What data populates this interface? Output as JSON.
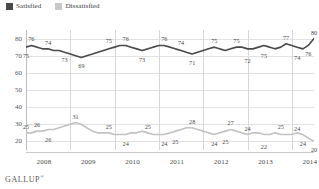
{
  "legend": {
    "items": [
      {
        "label": "Satisfied",
        "color": "#4a4a4a",
        "icon": "square-swatch-icon"
      },
      {
        "label": "Dissatisfied",
        "color": "#c8c8c8",
        "icon": "square-swatch-icon"
      }
    ]
  },
  "brand": {
    "name": "GALLUP",
    "mark": "®"
  },
  "axes": {
    "y_ticks": [
      "80",
      "70",
      "60",
      "50",
      "40",
      "30",
      "20"
    ],
    "x_ticks": [
      "2008",
      "2009",
      "2010",
      "2011",
      "2012",
      "2013",
      "2014"
    ]
  },
  "chart_data": {
    "type": "line",
    "title": "",
    "subtitle": "",
    "xlabel": "",
    "ylabel": "",
    "ylim": [
      15,
      85
    ],
    "grid": true,
    "legend_position": "top-left",
    "x": [
      2008.0,
      2008.12,
      2008.25,
      2008.37,
      2008.5,
      2008.62,
      2008.75,
      2008.87,
      2009.0,
      2009.12,
      2009.25,
      2009.37,
      2009.5,
      2009.62,
      2009.75,
      2009.87,
      2010.0,
      2010.12,
      2010.25,
      2010.37,
      2010.5,
      2010.62,
      2010.75,
      2010.87,
      2011.0,
      2011.12,
      2011.25,
      2011.37,
      2011.5,
      2011.62,
      2011.75,
      2011.87,
      2012.0,
      2012.12,
      2012.25,
      2012.37,
      2012.5,
      2012.62,
      2012.75,
      2012.87,
      2013.0,
      2013.12,
      2013.25,
      2013.37,
      2013.5,
      2013.62,
      2013.75,
      2013.87,
      2014.0,
      2014.12,
      2014.25,
      2014.37,
      2014.5
    ],
    "series": [
      {
        "name": "Satisfied",
        "color": "#4a4a4a",
        "values": [
          75,
          76,
          75,
          74,
          74,
          73,
          73,
          72,
          71,
          70,
          69,
          70,
          71,
          72,
          73,
          74,
          75,
          76,
          76,
          75,
          74,
          73,
          74,
          75,
          76,
          76,
          75,
          74,
          73,
          72,
          71,
          72,
          73,
          74,
          75,
          74,
          73,
          74,
          75,
          75,
          74,
          74,
          75,
          76,
          75,
          74,
          75,
          77,
          76,
          75,
          74,
          76,
          80
        ],
        "labeled_points": [
          {
            "x": 2008.0,
            "value": 75,
            "position": "below"
          },
          {
            "x": 2008.12,
            "value": 76,
            "position": "above"
          },
          {
            "x": 2008.5,
            "value": 74,
            "position": "above"
          },
          {
            "x": 2008.87,
            "value": 73,
            "position": "below"
          },
          {
            "x": 2009.25,
            "value": 69,
            "position": "below"
          },
          {
            "x": 2009.87,
            "value": 75,
            "position": "above"
          },
          {
            "x": 2010.25,
            "value": 76,
            "position": "above"
          },
          {
            "x": 2010.62,
            "value": 73,
            "position": "below"
          },
          {
            "x": 2011.12,
            "value": 76,
            "position": "above"
          },
          {
            "x": 2011.5,
            "value": 74,
            "position": "above"
          },
          {
            "x": 2011.75,
            "value": 71,
            "position": "below"
          },
          {
            "x": 2012.25,
            "value": 75,
            "position": "above"
          },
          {
            "x": 2012.75,
            "value": 75,
            "position": "above"
          },
          {
            "x": 2013.0,
            "value": 72,
            "position": "below"
          },
          {
            "x": 2013.37,
            "value": 75,
            "position": "below"
          },
          {
            "x": 2013.87,
            "value": 77,
            "position": "above"
          },
          {
            "x": 2014.12,
            "value": 74,
            "position": "below"
          },
          {
            "x": 2014.37,
            "value": 76,
            "position": "below"
          },
          {
            "x": 2014.5,
            "value": 80,
            "position": "above"
          }
        ]
      },
      {
        "name": "Dissatisfied",
        "color": "#c2c2c2",
        "values": [
          25,
          25,
          26,
          26,
          27,
          27,
          28,
          29,
          30,
          31,
          30,
          28,
          26,
          25,
          25,
          25,
          24,
          24,
          24,
          25,
          25,
          26,
          25,
          24,
          24,
          24,
          25,
          26,
          27,
          28,
          28,
          27,
          26,
          25,
          24,
          25,
          26,
          27,
          26,
          25,
          24,
          25,
          25,
          24,
          24,
          25,
          24,
          24,
          24,
          25,
          24,
          22,
          20
        ],
        "labeled_points": [
          {
            "x": 2008.0,
            "value": 25,
            "position": "above"
          },
          {
            "x": 2008.25,
            "value": 26,
            "position": "above"
          },
          {
            "x": 2008.5,
            "value": 26,
            "position": "below"
          },
          {
            "x": 2009.12,
            "value": 31,
            "position": "above"
          },
          {
            "x": 2009.87,
            "value": 25,
            "position": "above"
          },
          {
            "x": 2010.25,
            "value": 24,
            "position": "below"
          },
          {
            "x": 2010.75,
            "value": 25,
            "position": "above"
          },
          {
            "x": 2011.12,
            "value": 24,
            "position": "below"
          },
          {
            "x": 2011.37,
            "value": 25,
            "position": "below"
          },
          {
            "x": 2011.75,
            "value": 28,
            "position": "above"
          },
          {
            "x": 2012.25,
            "value": 24,
            "position": "below"
          },
          {
            "x": 2012.5,
            "value": 25,
            "position": "below"
          },
          {
            "x": 2012.62,
            "value": 27,
            "position": "above"
          },
          {
            "x": 2013.0,
            "value": 24,
            "position": "above"
          },
          {
            "x": 2013.37,
            "value": 22,
            "position": "below"
          },
          {
            "x": 2013.75,
            "value": 25,
            "position": "above"
          },
          {
            "x": 2014.12,
            "value": 24,
            "position": "above"
          },
          {
            "x": 2014.25,
            "value": 24,
            "position": "below"
          },
          {
            "x": 2014.5,
            "value": 20,
            "position": "below"
          }
        ]
      }
    ]
  }
}
